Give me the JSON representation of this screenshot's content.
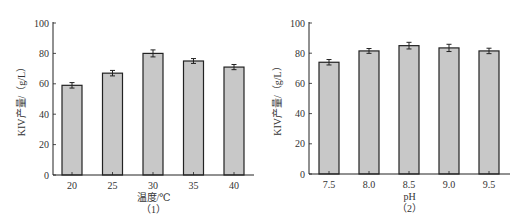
{
  "chart_data": [
    {
      "type": "bar",
      "title": "",
      "caption": "（1）",
      "xlabel": "温度/℃",
      "ylabel": "KIV产量/（g/L）",
      "categories": [
        "20",
        "25",
        "30",
        "35",
        "40"
      ],
      "values": [
        59,
        67,
        80,
        75,
        71
      ],
      "error": [
        1.8,
        1.8,
        2.3,
        1.6,
        1.7
      ],
      "ylim": [
        0,
        100
      ],
      "yticks": [
        0,
        20,
        40,
        60,
        80,
        100
      ],
      "grid": false,
      "legend": null,
      "bar_color": "#c8c8c8",
      "edge_color": "#222222"
    },
    {
      "type": "bar",
      "title": "",
      "caption": "（2）",
      "xlabel": "pH",
      "ylabel": "KIV产量/（g/L）",
      "categories": [
        "7.5",
        "8.0",
        "8.5",
        "9.0",
        "9.5"
      ],
      "values": [
        74,
        81.5,
        85,
        83.5,
        81.5
      ],
      "error": [
        1.8,
        1.6,
        2.2,
        2.4,
        1.8
      ],
      "ylim": [
        0,
        100
      ],
      "yticks": [
        0,
        20,
        40,
        60,
        80,
        100
      ],
      "grid": false,
      "legend": null,
      "bar_color": "#c8c8c8",
      "edge_color": "#222222"
    }
  ]
}
